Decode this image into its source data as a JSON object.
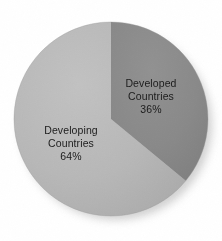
{
  "chart_data": {
    "type": "pie",
    "title": "",
    "subtitle": "",
    "xlabel": "",
    "ylabel": "",
    "legend_position": "none",
    "grid": false,
    "labels_inside_slices": true,
    "categories": [
      "Developed Countries",
      "Developing Countries"
    ],
    "values": [
      36,
      64
    ],
    "unit": "%",
    "start_angle_deg": 0,
    "direction": "clockwise",
    "slices": [
      {
        "name": "Developed Countries",
        "value": 36,
        "value_label": "36%",
        "color": "#8a8a8a",
        "start_angle_deg": 0,
        "end_angle_deg": 129.6,
        "label_lines": [
          "Developed",
          "Countries",
          "36%"
        ]
      },
      {
        "name": "Developing Countries",
        "value": 64,
        "value_label": "64%",
        "color": "#b8b8b8",
        "start_angle_deg": 129.6,
        "end_angle_deg": 360,
        "label_lines": [
          "Developing",
          "Countries",
          "64%"
        ]
      }
    ]
  },
  "figure": {
    "background_color": "#ffffff",
    "text_color": "#1c1c1c",
    "shadow_color": "#c9c9c9",
    "center_x": 111,
    "center_y": 119,
    "radius": 97
  },
  "labels": {
    "developed": {
      "line1": "Developed",
      "line2": "Countries",
      "line3": "36%"
    },
    "developing": {
      "line1": "Developing",
      "line2": "Countries",
      "line3": "64%"
    }
  }
}
